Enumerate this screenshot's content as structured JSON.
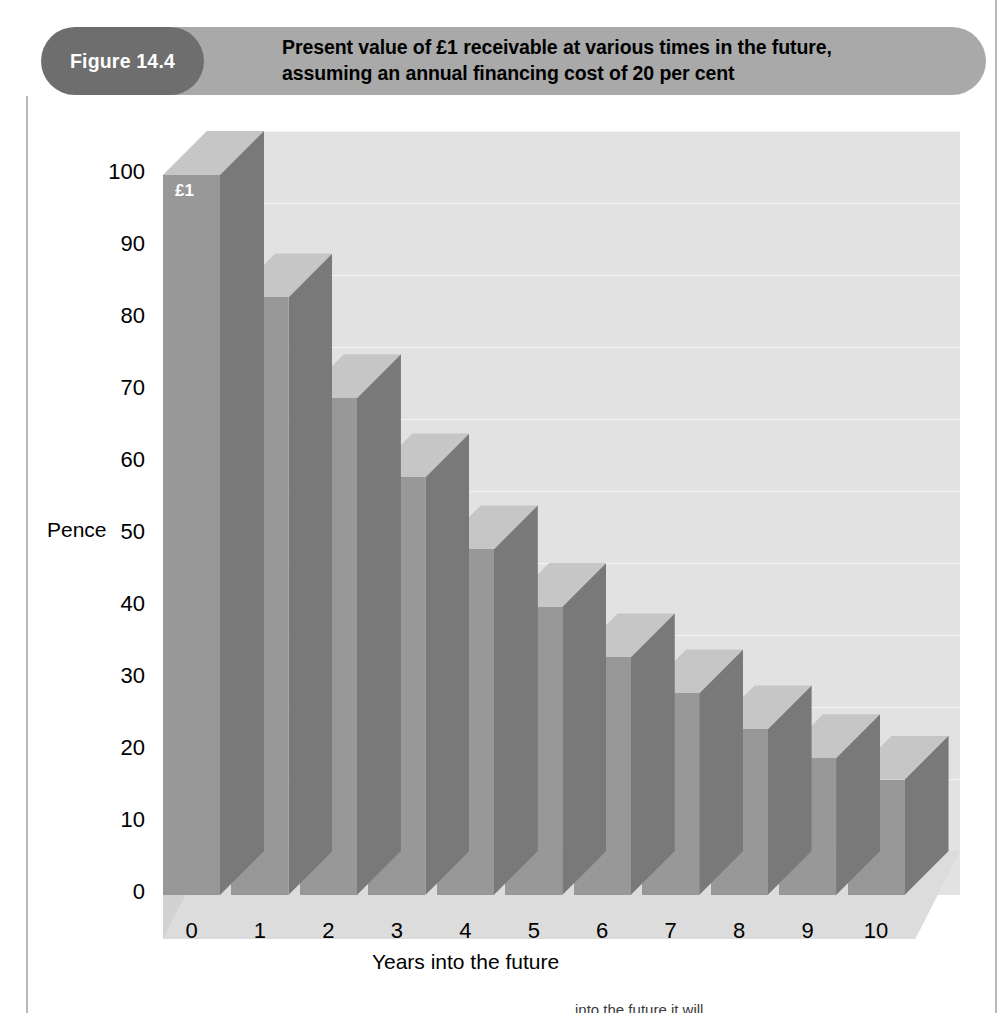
{
  "figure": {
    "number_label": "Figure 14.4",
    "title": "Present value of £1 receivable at various times in the future,\nassuming an annual financing cost of 20 per cent"
  },
  "colors": {
    "pill": "#6e6e6e",
    "banner": "#a9a9a9",
    "bar_front": "#989898",
    "bar_side": "#797979",
    "bar_top": "#c6c6c6",
    "wall": "#e2e2e2",
    "wall_left": "#d2d2d2",
    "floor": "#dcdcdc",
    "gridline": "#f4f4f4",
    "text": "#000000",
    "bar_label_text": "#ffffff"
  },
  "chart_data": {
    "type": "bar",
    "title": "Present value of £1 receivable at various times in the future, assuming an annual financing cost of 20 per cent",
    "subtitle": "",
    "xlabel": "Years into the future",
    "ylabel": "Pence",
    "categories": [
      "0",
      "1",
      "2",
      "3",
      "4",
      "5",
      "6",
      "7",
      "8",
      "9",
      "10"
    ],
    "values": [
      100,
      83,
      69,
      58,
      48,
      40,
      33,
      28,
      23,
      19,
      16
    ],
    "ylim": [
      0,
      100
    ],
    "yticks": [
      0,
      10,
      20,
      30,
      40,
      50,
      60,
      70,
      80,
      90,
      100
    ],
    "ytick_labels": [
      "0",
      "10",
      "20",
      "30",
      "40",
      "50",
      "60",
      "70",
      "80",
      "90",
      "100"
    ],
    "xtick_labels": [
      "0",
      "1",
      "2",
      "3",
      "4",
      "5",
      "6",
      "7",
      "8",
      "9",
      "10"
    ],
    "grid": true,
    "legend": false,
    "legend_position": "none",
    "three_d": true,
    "annotations": [
      {
        "text": "£1",
        "category": "0",
        "position": "inside-top-of-first-bar"
      }
    ]
  },
  "footer": {
    "clipped_text": "…into the future it will"
  }
}
